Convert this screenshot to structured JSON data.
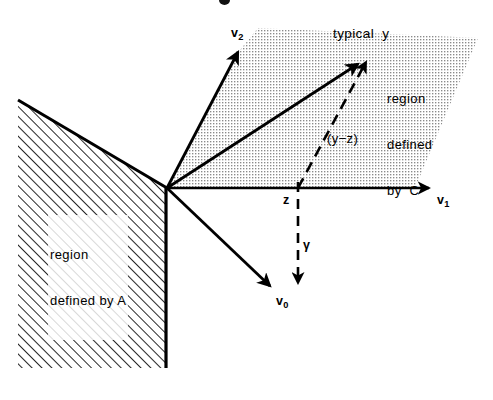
{
  "figure": {
    "background_color": "#ffffff",
    "line_color": "#000000",
    "hatch_fill_label": "diagonal-hatch",
    "dot_fill_label": "dotted-screen",
    "width": 493,
    "height": 400
  },
  "labels": {
    "typical_y": "typical  y",
    "region_c_line1": "region",
    "region_c_line2": "defined",
    "region_c_line3": "by  C",
    "region_a_line1": "region",
    "region_a_line2": "defined by A",
    "y_minus_z": "(y−z)",
    "v2": "v",
    "v2_sub": "2",
    "v1": "v",
    "v1_sub": "1",
    "v0": "v",
    "v0_sub": "0",
    "z": "z",
    "gamma": "γ"
  },
  "geometry": {
    "origin": {
      "x": 167,
      "y": 188
    },
    "axes": [
      {
        "name": "v1-axis",
        "from": [
          167,
          188
        ],
        "to": [
          432,
          188
        ],
        "style": "solid-arrow"
      },
      {
        "name": "v2-axis",
        "from": [
          167,
          188
        ],
        "to": [
          240,
          50
        ],
        "style": "solid-arrow"
      },
      {
        "name": "v0-axis",
        "from": [
          167,
          188
        ],
        "to": [
          272,
          288
        ],
        "style": "solid-arrow"
      },
      {
        "name": "y-vector",
        "from": [
          167,
          188
        ],
        "to": [
          360,
          62
        ],
        "style": "solid-arrow"
      }
    ],
    "dashed": [
      {
        "name": "y-minus-z-segment",
        "from": [
          298,
          188
        ],
        "to": [
          368,
          60
        ],
        "style": "dashed-arrow"
      },
      {
        "name": "gamma-segment",
        "from": [
          298,
          182
        ],
        "to": [
          298,
          285
        ],
        "style": "dashed-arrow"
      }
    ],
    "hatched_region": {
      "name": "region-defined-by-A",
      "points": "18,100 167,188 167,368 18,368"
    },
    "dotted_region": {
      "name": "region-defined-by-C",
      "points": "167,188 240,50 258,28 478,38 415,188"
    }
  },
  "scan_artifacts": {
    "bottom_bleed_text": "                                                       ",
    "top_clipped_mark": "clipped-caption-descender"
  }
}
